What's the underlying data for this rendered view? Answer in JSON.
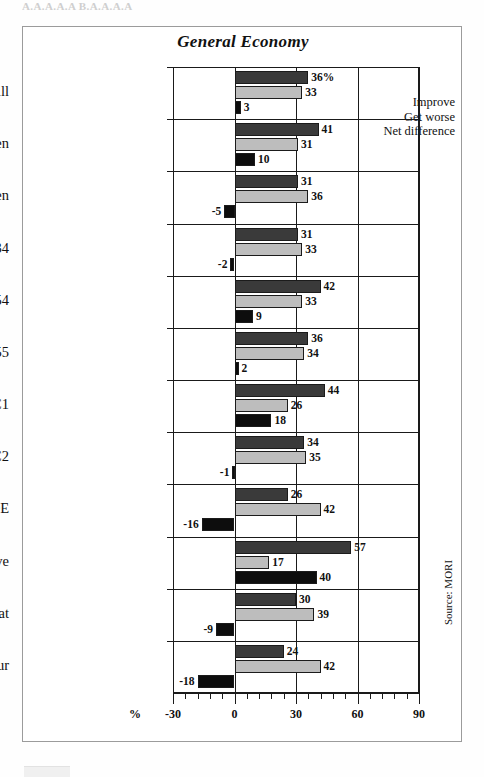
{
  "scan_artifacts": {
    "top_text": "A.A.A.A.A  B.A.A.A.A"
  },
  "frame": {
    "title": "General Economy",
    "source_note": "Source: MORI"
  },
  "legend": {
    "position": "top-right-inside-plot",
    "items": [
      {
        "key": "improve",
        "label": "Improve",
        "color": "#3a3a3a"
      },
      {
        "key": "worse",
        "label": "Get worse",
        "color": "#bdbdbd"
      },
      {
        "key": "net",
        "label": "Net difference",
        "color": "#0d0d0d"
      }
    ]
  },
  "axis": {
    "percent_symbol": "%",
    "tick_labels": [
      "-30",
      "0",
      "30",
      "60",
      "90"
    ],
    "tick_values": [
      -30,
      0,
      30,
      60,
      90
    ],
    "minor_tick_step": 6
  },
  "chart_data": {
    "type": "bar",
    "orientation": "horizontal",
    "title": "General Economy",
    "xlabel": "%",
    "ylabel": "",
    "xlim": [
      -30,
      90
    ],
    "grid": true,
    "legend_position": "top-right",
    "value_suffix_first": "%",
    "categories": [
      "All",
      "Men",
      "Women",
      "15-34",
      "35-54",
      "Over 55",
      "ABC1",
      "C2",
      "DE",
      "Conservative",
      "Liberal Democrat",
      "Labour"
    ],
    "series": [
      {
        "name": "Improve",
        "color": "#3a3a3a",
        "values": [
          36,
          41,
          31,
          31,
          42,
          36,
          44,
          34,
          26,
          57,
          30,
          24
        ]
      },
      {
        "name": "Get worse",
        "color": "#bdbdbd",
        "values": [
          33,
          31,
          36,
          33,
          33,
          34,
          26,
          35,
          42,
          17,
          39,
          42
        ]
      },
      {
        "name": "Net difference",
        "color": "#0d0d0d",
        "values": [
          3,
          10,
          -5,
          -2,
          9,
          2,
          18,
          -1,
          -16,
          40,
          -9,
          -18
        ]
      }
    ],
    "labels": {
      "Improve": [
        "36%",
        "41",
        "31",
        "31",
        "42",
        "36",
        "44",
        "34",
        "26",
        "57",
        "30",
        "24"
      ],
      "Get worse": [
        "33",
        "31",
        "36",
        "33",
        "33",
        "34",
        "26",
        "35",
        "42",
        "17",
        "39",
        "42"
      ],
      "Net difference": [
        "3",
        "10",
        "-5",
        "-2",
        "9",
        "2",
        "18",
        "-1",
        "-16",
        "40",
        "-9",
        "-18"
      ]
    }
  }
}
